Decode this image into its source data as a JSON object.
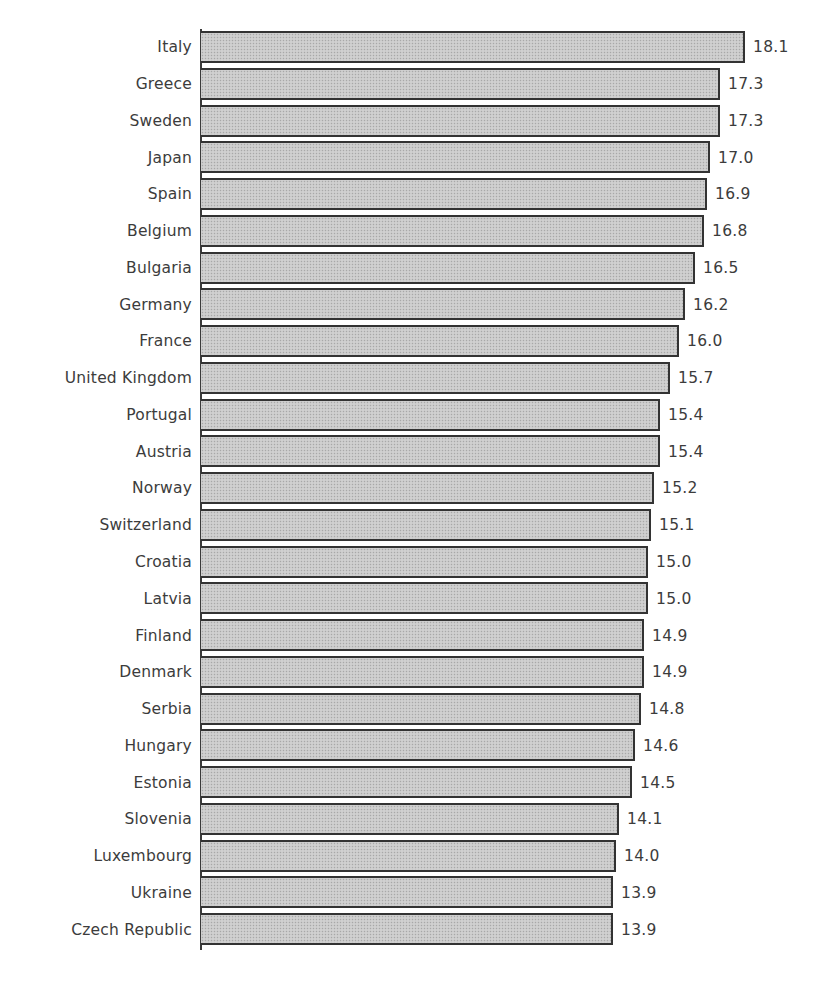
{
  "chart_data": {
    "type": "bar",
    "orientation": "horizontal",
    "title": "",
    "xlabel": "",
    "ylabel": "",
    "categories": [
      "Italy",
      "Greece",
      "Sweden",
      "Japan",
      "Spain",
      "Belgium",
      "Bulgaria",
      "Germany",
      "France",
      "United Kingdom",
      "Portugal",
      "Austria",
      "Norway",
      "Switzerland",
      "Croatia",
      "Latvia",
      "Finland",
      "Denmark",
      "Serbia",
      "Hungary",
      "Estonia",
      "Slovenia",
      "Luxembourg",
      "Ukraine",
      "Czech Republic"
    ],
    "values": [
      18.1,
      17.3,
      17.3,
      17.0,
      16.9,
      16.8,
      16.5,
      16.2,
      16.0,
      15.7,
      15.4,
      15.4,
      15.2,
      15.1,
      15.0,
      15.0,
      14.9,
      14.9,
      14.8,
      14.6,
      14.5,
      14.1,
      14.0,
      13.9,
      13.9
    ],
    "value_labels": [
      "18.1",
      "17.3",
      "17.3",
      "17.0",
      "16.9",
      "16.8",
      "16.5",
      "16.2",
      "16.0",
      "15.7",
      "15.4",
      "15.4",
      "15.2",
      "15.1",
      "15.0",
      "15.0",
      "14.9",
      "14.9",
      "14.8",
      "14.6",
      "14.5",
      "14.1",
      "14.0",
      "13.9",
      "13.9"
    ],
    "grid": false,
    "legend": null,
    "data_labels": true
  },
  "style": {
    "bar_fill": "#c9c9c9",
    "bar_border": "#333333",
    "text_color": "#3c3c3c"
  },
  "layout": {
    "plot_left": 201,
    "plot_top": 29,
    "row_height": 36.76,
    "px_per_unit": 31.43,
    "axis_origin_value": 0.79
  }
}
